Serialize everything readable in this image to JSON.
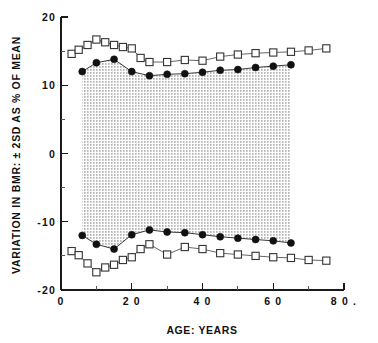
{
  "figure": {
    "name": "bmr-variation-vs-age-chart",
    "background_color": "#ffffff",
    "ink_color": "#111111"
  },
  "chart_data": {
    "type": "line",
    "title": "",
    "xlabel": "AGE: YEARS",
    "ylabel": "VARIATION IN BMR: ± 2SD AS % OF MEAN",
    "xlim": [
      0,
      80
    ],
    "ylim": [
      -20,
      20
    ],
    "xticks": [
      0,
      20,
      40,
      60,
      80
    ],
    "xticklabels": [
      "0",
      "2 0",
      "4 0",
      "6 0",
      "8 0 ."
    ],
    "xminorticks": [
      10,
      30,
      50,
      70
    ],
    "yticks": [
      20,
      10,
      0,
      -10,
      -20
    ],
    "yticklabels": [
      "20",
      "10",
      "0",
      "-10",
      "-20"
    ],
    "yminorticks": [
      15,
      5,
      -5,
      -15
    ],
    "grid": false,
    "legend": false,
    "legend_position": "none",
    "shaded_band": {
      "label": "stippled region between inner (filled circle) bounds",
      "pattern": "stipple-dots",
      "between_series": [
        "upper-inner-filled-circles",
        "lower-inner-filled-circles"
      ]
    },
    "series": [
      {
        "name": "upper-outer-open-squares",
        "marker": "open-square",
        "x": [
          3,
          5,
          7.5,
          10,
          12.5,
          15,
          17.5,
          20,
          22.5,
          25,
          30,
          35,
          40,
          45,
          50,
          55,
          60,
          65,
          70,
          75
        ],
        "values": [
          14.6,
          15.2,
          15.9,
          16.7,
          16.3,
          15.9,
          15.6,
          15.4,
          14.0,
          13.4,
          13.4,
          13.7,
          13.6,
          14.2,
          14.5,
          14.7,
          14.8,
          14.9,
          15.1,
          15.4
        ]
      },
      {
        "name": "upper-inner-filled-circles",
        "marker": "filled-circle",
        "x": [
          6,
          10,
          15,
          20,
          25,
          30,
          35,
          40,
          45,
          50,
          55,
          60,
          65
        ],
        "values": [
          12.0,
          13.3,
          13.8,
          12.0,
          11.4,
          11.6,
          11.7,
          11.9,
          12.2,
          12.3,
          12.6,
          12.8,
          13.0
        ]
      },
      {
        "name": "lower-inner-filled-circles",
        "marker": "filled-circle",
        "x": [
          6,
          10,
          15,
          20,
          25,
          30,
          35,
          40,
          45,
          50,
          55,
          60,
          65
        ],
        "values": [
          -12.0,
          -13.3,
          -14.0,
          -11.9,
          -11.2,
          -11.5,
          -11.6,
          -11.9,
          -12.2,
          -12.4,
          -12.6,
          -12.8,
          -13.1
        ]
      },
      {
        "name": "lower-outer-open-squares",
        "marker": "open-square",
        "x": [
          3,
          5,
          7.5,
          10,
          12.5,
          15,
          17.5,
          20,
          22.5,
          25,
          30,
          35,
          40,
          45,
          50,
          55,
          60,
          65,
          70,
          75
        ],
        "values": [
          -14.3,
          -14.9,
          -16.1,
          -17.4,
          -16.7,
          -16.3,
          -15.6,
          -15.2,
          -14.0,
          -13.3,
          -14.8,
          -13.7,
          -14.0,
          -14.6,
          -14.8,
          -15.0,
          -15.2,
          -15.3,
          -15.6,
          -15.7
        ]
      }
    ]
  },
  "axis_labels": {
    "x_title": "AGE: YEARS",
    "y_title": "VARIATION IN BMR: ± 2SD AS % OF MEAN"
  },
  "caption": {
    "partial_text": ""
  }
}
